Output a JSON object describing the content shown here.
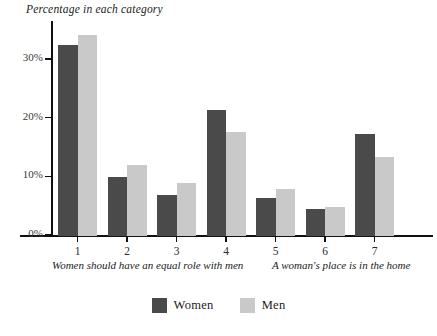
{
  "chart_data": {
    "type": "bar",
    "title": "Percentage in each category",
    "xlabel": "",
    "ylabel": "",
    "categories": [
      "1",
      "2",
      "3",
      "4",
      "5",
      "6",
      "7"
    ],
    "series": [
      {
        "name": "Women",
        "color": "#4a4a4a",
        "values": [
          32.5,
          10.0,
          7.0,
          21.5,
          6.4,
          4.6,
          17.4
        ]
      },
      {
        "name": "Men",
        "color": "#c9c9c9",
        "values": [
          34.3,
          12.1,
          9.1,
          17.8,
          8.1,
          5.0,
          13.5
        ]
      }
    ],
    "ylim": [
      0,
      36.5
    ],
    "yticks": [
      0,
      10,
      20,
      30
    ],
    "ytick_labels": [
      "0%",
      "10%",
      "20%",
      "30%"
    ],
    "grid": false,
    "legend_position": "bottom-center",
    "annotations": {
      "scale_anchor_left": "Women should have an equal role with men",
      "scale_anchor_right": "A woman's place is in the home"
    }
  },
  "legend": {
    "items": [
      {
        "label": "Women",
        "color": "#4a4a4a"
      },
      {
        "label": "Men",
        "color": "#c9c9c9"
      }
    ]
  }
}
